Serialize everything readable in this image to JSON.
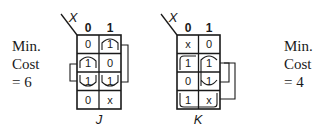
{
  "left_cost": {
    "line1": "Min.",
    "line2": "Cost",
    "line3": "= 6"
  },
  "right_cost": {
    "line1": "Min.",
    "line2": "Cost",
    "line3": "= 4"
  },
  "maps": [
    {
      "name": "J",
      "corner_var": "X",
      "col_headers": [
        "0",
        "1"
      ],
      "cells": [
        [
          "0",
          "1"
        ],
        [
          "1",
          "0"
        ],
        [
          "1",
          "1"
        ],
        [
          "0",
          "x"
        ]
      ],
      "label": "J"
    },
    {
      "name": "K",
      "corner_var": "X",
      "col_headers": [
        "0",
        "1"
      ],
      "cells": [
        [
          "x",
          "0"
        ],
        [
          "1",
          "1"
        ],
        [
          "0",
          "1"
        ],
        [
          "1",
          "x"
        ]
      ],
      "label": "K"
    }
  ],
  "colors": {
    "ink": "#1a1a1a",
    "background": "#ffffff"
  }
}
